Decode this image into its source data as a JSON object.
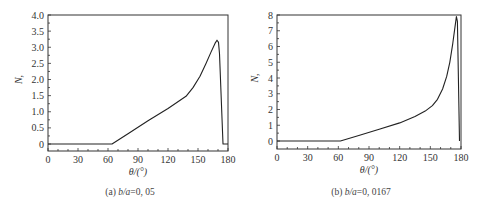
{
  "chart_data": [
    {
      "type": "line",
      "panel": "a",
      "caption": "(a) b/a=0, 05",
      "caption_parts": {
        "prefix": "(a) ",
        "ratio": "b/a",
        "value": "=0, 05"
      },
      "xlabel": "θ/(°)",
      "ylabel": "N,",
      "xlim": [
        0,
        180
      ],
      "ylim": [
        -0.15,
        4.0
      ],
      "xticks": [
        0,
        30,
        60,
        90,
        120,
        150,
        180
      ],
      "xtick_labels": [
        "0",
        "30",
        "60",
        "90",
        "120",
        "150",
        "180"
      ],
      "yticks": [
        0,
        0.5,
        1.0,
        1.5,
        2.0,
        2.5,
        3.0,
        3.5,
        4.0
      ],
      "ytick_labels": [
        "0",
        "0.5",
        "1.0",
        "1.5",
        "2.0",
        "2.5",
        "3.0",
        "3.5",
        "4.0"
      ],
      "grid": false,
      "series": [
        {
          "name": "N",
          "x": [
            0,
            64,
            80,
            100,
            120,
            138,
            145,
            152,
            158,
            163,
            167,
            169,
            170.5,
            171.5,
            172.5,
            174,
            175,
            178,
            180
          ],
          "y": [
            0,
            0,
            0.32,
            0.72,
            1.1,
            1.48,
            1.75,
            2.1,
            2.5,
            2.85,
            3.12,
            3.22,
            3.15,
            2.8,
            2.0,
            0.8,
            0,
            0,
            0
          ]
        }
      ],
      "frame_px": {
        "left": 48,
        "right": 228,
        "top": 15,
        "bottom": 151
      },
      "zero_px": 144
    },
    {
      "type": "line",
      "panel": "b",
      "caption": "(b) b/a=0, 0167",
      "caption_parts": {
        "prefix": "(b) ",
        "ratio": "b/a",
        "value": "=0, 0167"
      },
      "xlabel": "θ/(°)",
      "ylabel": "N,",
      "xlim": [
        0,
        180
      ],
      "ylim": [
        -0.5,
        8
      ],
      "xticks": [
        0,
        30,
        60,
        90,
        120,
        150,
        180
      ],
      "xtick_labels": [
        "0",
        "30",
        "60",
        "90",
        "120",
        "150",
        "180"
      ],
      "yticks": [
        0,
        1,
        2,
        3,
        4,
        5,
        6,
        7,
        8
      ],
      "ytick_labels": [
        "0",
        "1",
        "2",
        "3",
        "4",
        "5",
        "6",
        "7",
        "8"
      ],
      "grid": false,
      "series": [
        {
          "name": "N",
          "x": [
            0,
            62,
            80,
            100,
            120,
            135,
            145,
            152,
            157,
            162,
            166,
            169,
            172,
            174,
            175.5,
            176.5,
            177.5,
            178.5
          ],
          "y": [
            0,
            0,
            0.35,
            0.75,
            1.15,
            1.55,
            1.9,
            2.25,
            2.65,
            3.3,
            4.1,
            5.0,
            6.2,
            7.2,
            7.9,
            7.6,
            4.0,
            0
          ]
        }
      ],
      "frame_px": {
        "left": 277,
        "right": 461,
        "top": 15,
        "bottom": 149
      },
      "zero_px": 141
    }
  ]
}
